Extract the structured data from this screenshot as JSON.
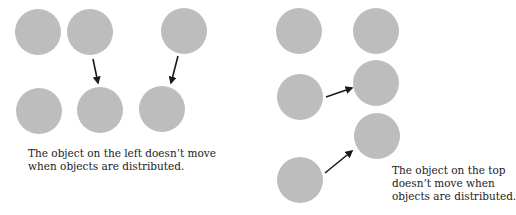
{
  "colors": {
    "circle_fill": "#bdbdbd",
    "arrow": "#1a1a1a",
    "text": "#222222",
    "background": "#ffffff"
  },
  "panels": [
    {
      "name": "distribute-horizontal",
      "circles": [
        {
          "cx": 38,
          "cy": 32,
          "r": 23
        },
        {
          "cx": 90,
          "cy": 32,
          "r": 23
        },
        {
          "cx": 184,
          "cy": 31,
          "r": 23
        },
        {
          "cx": 39,
          "cy": 111,
          "r": 23
        },
        {
          "cx": 100,
          "cy": 110,
          "r": 23
        },
        {
          "cx": 162,
          "cy": 109,
          "r": 23
        }
      ],
      "arrows": [
        {
          "x1": 93,
          "y1": 59,
          "x2": 98,
          "y2": 83
        },
        {
          "x1": 178,
          "y1": 56,
          "x2": 171,
          "y2": 83
        }
      ],
      "caption": {
        "lines": [
          "The object on the left doesn’t move",
          "when objects are distributed."
        ]
      }
    },
    {
      "name": "distribute-vertical",
      "circles": [
        {
          "cx": 299,
          "cy": 31,
          "r": 23
        },
        {
          "cx": 376,
          "cy": 31,
          "r": 23
        },
        {
          "cx": 300,
          "cy": 97,
          "r": 23
        },
        {
          "cx": 376,
          "cy": 83,
          "r": 23
        },
        {
          "cx": 377,
          "cy": 136,
          "r": 23
        },
        {
          "cx": 300,
          "cy": 180,
          "r": 23
        }
      ],
      "arrows": [
        {
          "x1": 326,
          "y1": 97,
          "x2": 352,
          "y2": 88
        },
        {
          "x1": 325,
          "y1": 173,
          "x2": 352,
          "y2": 151
        }
      ],
      "caption": {
        "lines": [
          "The object on the top",
          "doesn’t move when",
          "objects are distributed."
        ]
      }
    }
  ]
}
